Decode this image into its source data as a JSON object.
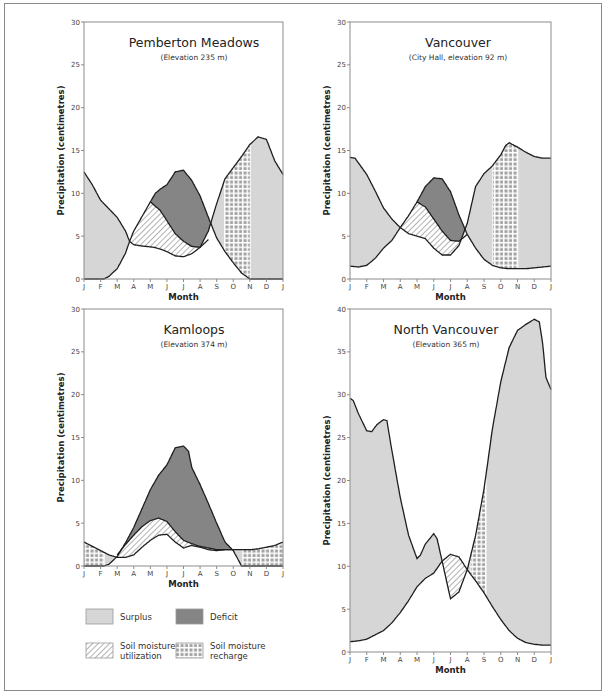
{
  "colors": {
    "surplus": "#d6d6d6",
    "deficit": "#858585",
    "line": "#1e1e1e",
    "axis": "#8c8c8c",
    "hatch": "#555555",
    "recharge_square": "#a0a0a0"
  },
  "legend": {
    "items": [
      {
        "key": "surplus",
        "label": [
          "Surplus"
        ]
      },
      {
        "key": "deficit",
        "label": [
          "Deficit"
        ]
      },
      {
        "key": "utilization",
        "label": [
          "Soil moisture",
          "utilization"
        ]
      },
      {
        "key": "recharge",
        "label": [
          "Soil moisture",
          "recharge"
        ]
      }
    ]
  },
  "chart_data": [
    {
      "type": "area",
      "title": "Pemberton Meadows",
      "subtitle": "(Elevation 235 m)",
      "xlabel": "Month",
      "ylabel": "Precipitation (centimetres)",
      "x_ticks": [
        "J",
        "F",
        "M",
        "A",
        "M",
        "J",
        "J",
        "A",
        "S",
        "O",
        "N",
        "D",
        "J"
      ],
      "y_ticks": [
        0,
        5,
        10,
        15,
        20,
        25,
        30
      ],
      "ylim": [
        0,
        30
      ],
      "frame": {
        "x0": 84,
        "x1": 283,
        "ybottom": 279,
        "ytop": 22
      },
      "title_pos": {
        "x": 194,
        "y": 47,
        "sub_y": 60
      },
      "series": [
        {
          "name": "Precipitation",
          "x": [
            0,
            0.5,
            1,
            1.5,
            2,
            2.5,
            2.75,
            3,
            3.5,
            4,
            4.2,
            4.6,
            5,
            5.5,
            6,
            6.5,
            7,
            7.5,
            8,
            8.5,
            9,
            9.5,
            10,
            10.5,
            11,
            11.5,
            12
          ],
          "values": [
            12.5,
            11,
            9.2,
            8.2,
            7.2,
            5.6,
            4.4,
            4.0,
            3.85,
            3.75,
            3.7,
            3.5,
            3.2,
            2.7,
            2.6,
            2.95,
            3.7,
            5.6,
            8.8,
            11.7,
            13.0,
            14.3,
            15.7,
            16.6,
            16.3,
            13.8,
            12.2
          ]
        },
        {
          "name": "Potential evapotranspiration",
          "x": [
            0,
            0.5,
            1,
            1.2,
            1.5,
            2,
            2.5,
            2.75,
            3,
            3.5,
            4,
            4.3,
            4.6,
            5,
            5.5,
            6,
            6.5,
            7,
            7.5,
            8,
            8.5,
            9,
            9.5,
            10,
            10.5,
            11,
            11.5,
            12
          ],
          "values": [
            0,
            0,
            0,
            0,
            0.3,
            1.2,
            3.0,
            4.4,
            5.6,
            7.3,
            9.0,
            10.0,
            10.5,
            11.0,
            12.5,
            12.7,
            11.5,
            9.7,
            7.2,
            4.8,
            3.2,
            1.9,
            0.7,
            0,
            0,
            0,
            0,
            0
          ]
        },
        {
          "name": "Actual evapotranspiration (utilization boundary)",
          "x": [
            4,
            4.6,
            5,
            5.5,
            6,
            6.5,
            7,
            7.5
          ],
          "values": [
            9.0,
            8.0,
            6.8,
            5.3,
            4.4,
            3.8,
            3.7,
            4.6
          ]
        }
      ],
      "regions": {
        "surplus": [
          "Jan–mid Mar",
          "Oct–Jan"
        ],
        "deficit": "May–Aug",
        "utilization": "Apr–Aug",
        "recharge": "Sep–Oct"
      }
    },
    {
      "type": "area",
      "title": "Vancouver",
      "subtitle": "(City Hall, elevation 92 m)",
      "xlabel": "Month",
      "ylabel": "Precipitation (centimetres)",
      "x_ticks": [
        "J",
        "F",
        "M",
        "A",
        "M",
        "J",
        "J",
        "A",
        "S",
        "O",
        "N",
        "D",
        "J"
      ],
      "y_ticks": [
        0,
        5,
        10,
        15,
        20,
        25,
        30
      ],
      "ylim": [
        0,
        30
      ],
      "frame": {
        "x0": 350,
        "x1": 551,
        "ybottom": 279,
        "ytop": 22
      },
      "title_pos": {
        "x": 458,
        "y": 47,
        "sub_y": 60
      },
      "series": [
        {
          "name": "Precipitation",
          "x": [
            0,
            0.3,
            1,
            1.5,
            2,
            2.5,
            3,
            3.5,
            4,
            4.5,
            5,
            5.5,
            6,
            6.5,
            7,
            7.5,
            8,
            8.5,
            9,
            9.3,
            9.5,
            10,
            10.5,
            11,
            11.5,
            12
          ],
          "values": [
            14.2,
            14.1,
            12.2,
            10.3,
            8.3,
            7.0,
            6.0,
            5.3,
            5.0,
            4.7,
            3.6,
            2.8,
            2.8,
            3.9,
            6.5,
            10.8,
            12.3,
            13.2,
            14.5,
            15.6,
            15.9,
            15.4,
            14.8,
            14.3,
            14.1,
            14.1
          ]
        },
        {
          "name": "Potential evapotranspiration",
          "x": [
            0,
            0.5,
            1,
            1.5,
            2,
            2.5,
            3,
            3.5,
            4,
            4.5,
            5,
            5.5,
            6,
            6.5,
            7,
            7.5,
            8,
            8.5,
            9,
            9.5,
            10,
            10.5,
            11,
            11.5,
            12
          ],
          "values": [
            1.5,
            1.4,
            1.6,
            2.4,
            3.6,
            4.5,
            6.0,
            7.4,
            9.0,
            10.8,
            11.8,
            11.7,
            10.2,
            7.5,
            5.2,
            3.6,
            2.3,
            1.6,
            1.3,
            1.2,
            1.2,
            1.2,
            1.3,
            1.4,
            1.5
          ]
        },
        {
          "name": "Actual evapotranspiration (utilization boundary)",
          "x": [
            4,
            4.5,
            5,
            5.5,
            6,
            6.5,
            7
          ],
          "values": [
            9.0,
            8.4,
            7.0,
            5.6,
            4.5,
            4.4,
            5.2
          ]
        }
      ],
      "regions": {
        "surplus": [
          "Jan–Apr",
          "Oct–Jan"
        ],
        "deficit": "May–Aug",
        "utilization": "Apr–Aug",
        "recharge": "Sep–Oct"
      }
    },
    {
      "type": "area",
      "title": "Kamloops",
      "subtitle": "(Elevation 374 m)",
      "xlabel": "Month",
      "ylabel": "Precipitation (centimetres)",
      "x_ticks": [
        "J",
        "F",
        "M",
        "A",
        "M",
        "J",
        "J",
        "A",
        "S",
        "O",
        "N",
        "D",
        "J"
      ],
      "y_ticks": [
        0,
        5,
        10,
        15,
        20,
        25,
        30
      ],
      "ylim": [
        0,
        30
      ],
      "frame": {
        "x0": 84,
        "x1": 283,
        "ybottom": 566,
        "ytop": 309
      },
      "title_pos": {
        "x": 194,
        "y": 334,
        "sub_y": 347
      },
      "series": [
        {
          "name": "Precipitation",
          "x": [
            0,
            0.5,
            1,
            1.5,
            2,
            2.5,
            3,
            3.5,
            4,
            4.5,
            5,
            5.5,
            6,
            6.5,
            7,
            7.5,
            8,
            8.5,
            9,
            9.5,
            10,
            10.5,
            11,
            11.5,
            12
          ],
          "values": [
            2.8,
            2.3,
            1.8,
            1.3,
            1.0,
            1.0,
            1.3,
            2.2,
            3.0,
            3.6,
            3.7,
            2.8,
            2.1,
            2.4,
            2.2,
            1.9,
            1.8,
            1.9,
            1.9,
            1.9,
            1.9,
            2.0,
            2.2,
            2.4,
            2.8
          ]
        },
        {
          "name": "Potential evapotranspiration",
          "x": [
            0,
            1,
            1.2,
            1.5,
            2,
            2.5,
            3,
            3.5,
            4,
            4.5,
            5,
            5.5,
            6,
            6.3,
            6.5,
            7,
            7.5,
            8,
            8.5,
            9,
            9.5,
            10,
            11,
            12
          ],
          "values": [
            0,
            0,
            0,
            0.2,
            1.1,
            2.7,
            4.5,
            6.7,
            8.9,
            10.6,
            11.8,
            13.8,
            14.0,
            13.4,
            11.5,
            9.5,
            7.3,
            5.0,
            2.8,
            1.8,
            0,
            0,
            0,
            0
          ]
        },
        {
          "name": "Actual evapotranspiration (utilization boundary)",
          "x": [
            2,
            2.5,
            3,
            3.5,
            4,
            4.5,
            5,
            5.5,
            6,
            6.5,
            7,
            7.5,
            8,
            8.5,
            9
          ],
          "values": [
            1.3,
            2.5,
            3.6,
            4.6,
            5.3,
            5.6,
            5.2,
            4.0,
            3.0,
            2.6,
            2.3,
            2.1,
            1.9,
            1.9,
            1.9
          ]
        }
      ],
      "regions": {
        "surplus": [],
        "deficit": "Mar–Oct",
        "utilization": "Mar–Sep",
        "recharge": [
          "Oct–Jan",
          "Jan–Feb"
        ]
      }
    },
    {
      "type": "area",
      "title": "North Vancouver",
      "subtitle": "(Elevation 365 m)",
      "xlabel": "Month",
      "ylabel": "Precipitation (centimetres)",
      "x_ticks": [
        "J",
        "F",
        "M",
        "A",
        "M",
        "J",
        "J",
        "A",
        "S",
        "O",
        "N",
        "D",
        "J"
      ],
      "y_ticks": [
        0,
        5,
        10,
        15,
        20,
        25,
        30,
        35,
        40
      ],
      "ylim": [
        0,
        40
      ],
      "frame": {
        "x0": 350,
        "x1": 551,
        "ybottom": 652,
        "ytop": 309
      },
      "title_pos": {
        "x": 446,
        "y": 334,
        "sub_y": 347
      },
      "series": [
        {
          "name": "Precipitation",
          "x": [
            0,
            0.2,
            0.5,
            1,
            1.3,
            1.6,
            2,
            2.2,
            2.5,
            3,
            3.5,
            4,
            4.2,
            4.5,
            5,
            5.2,
            5.5,
            6,
            6.5,
            7,
            7.5,
            8,
            8.5,
            9,
            9.5,
            10,
            10.5,
            11,
            11.3,
            11.5,
            11.7,
            12
          ],
          "values": [
            29.6,
            29.3,
            27.8,
            25.8,
            25.7,
            26.5,
            27.1,
            27.0,
            23.5,
            18.0,
            13.6,
            10.9,
            11.3,
            12.6,
            13.8,
            13.2,
            10.6,
            6.2,
            7.0,
            9.6,
            13.6,
            19.0,
            26.0,
            31.5,
            35.5,
            37.5,
            38.2,
            38.8,
            38.5,
            36.0,
            32.0,
            30.6
          ]
        },
        {
          "name": "Potential evapotranspiration",
          "x": [
            0,
            0.5,
            1,
            1.5,
            2,
            2.5,
            3,
            3.5,
            4,
            4.5,
            5,
            5.5,
            6,
            6.5,
            7,
            7.5,
            8,
            8.5,
            9,
            9.5,
            10,
            10.5,
            11,
            11.5,
            12
          ],
          "values": [
            1.2,
            1.3,
            1.5,
            2.0,
            2.5,
            3.4,
            4.6,
            6.0,
            7.6,
            8.6,
            9.2,
            10.6,
            11.4,
            11.1,
            9.6,
            8.3,
            6.9,
            5.3,
            3.8,
            2.5,
            1.6,
            1.1,
            0.9,
            0.8,
            0.8
          ]
        }
      ],
      "regions": {
        "surplus": [
          "Jan–Jun",
          "Aug–Jan"
        ],
        "deficit": "none",
        "utilization": "Jun–Aug",
        "recharge": "Aug–Sep"
      }
    }
  ]
}
